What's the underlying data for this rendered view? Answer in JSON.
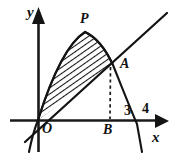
{
  "figure": {
    "kind": "math-diagram",
    "background_color": "#ffffff",
    "ink_color": "#141414"
  },
  "axes": {
    "x_axis": {
      "label": "x",
      "name": "x-axis",
      "origin_px": [
        38,
        120
      ],
      "tip_px": [
        168,
        121
      ],
      "arrow": "right"
    },
    "y_axis": {
      "label": "y",
      "name": "y-axis",
      "origin_px": [
        38,
        120
      ],
      "tip_px": [
        38,
        8
      ],
      "arrow": "up"
    },
    "origin_label": "O"
  },
  "points": [
    {
      "label": "O",
      "name": "origin-point",
      "px": [
        38,
        120
      ]
    },
    {
      "label": "P",
      "name": "parabola-vertex",
      "px": [
        85,
        32
      ]
    },
    {
      "label": "A",
      "name": "intersection-point",
      "px": [
        113,
        65
      ]
    },
    {
      "label": "B",
      "name": "foot-of-perpendicular",
      "px": [
        110,
        120
      ]
    }
  ],
  "tick_labels": [
    {
      "text": "3",
      "name": "x-tick-3",
      "px": [
        128,
        110
      ]
    },
    {
      "text": "4",
      "name": "x-tick-4",
      "px": [
        146,
        108
      ]
    }
  ],
  "curves": {
    "parabola": {
      "name": "parabola-curve",
      "note": "downward opening parabola through origin, vertex near P, crosses x-axis near 4",
      "vertex_px": [
        85,
        32
      ],
      "x_intercepts_px": [
        [
          38,
          120
        ],
        [
          137,
          124
        ]
      ]
    },
    "line": {
      "name": "secant-line",
      "note": "straight line through origin and point A, extended both directions",
      "from_px": [
        26,
        141
      ],
      "to_px": [
        166,
        13
      ]
    },
    "dashed_segment": {
      "name": "dashed-perpendicular",
      "note": "vertical dashed segment from A down to B on the x-axis",
      "from_px": [
        111,
        68
      ],
      "to_px": [
        110,
        119
      ]
    }
  },
  "shaded_region": {
    "name": "hatched-region",
    "hatch_style": "diagonal-lines",
    "hatch_angle_deg": 55,
    "hatch_color": "#141414",
    "bounded_above_by": "parabola-curve",
    "bounded_below_by": "secant-line",
    "vertices": [
      "O",
      "P",
      "A"
    ]
  }
}
